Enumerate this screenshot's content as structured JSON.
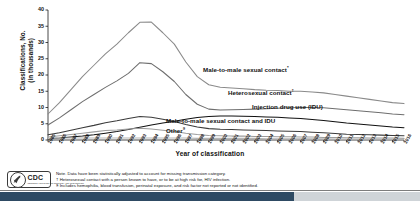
{
  "chart_data": {
    "type": "line",
    "title": "",
    "xlabel": "Year of classification",
    "ylabel_lines": [
      "Classifications, No.",
      "(in thousands)"
    ],
    "ylim": [
      0,
      40
    ],
    "yticks": [
      0,
      5,
      10,
      15,
      20,
      25,
      30,
      35,
      40
    ],
    "grid": false,
    "legend_position": "inline-labels",
    "categories": [
      "1985",
      "1986",
      "1987",
      "1988",
      "1989",
      "1990",
      "1991",
      "1992",
      "1993",
      "1994",
      "1995",
      "1996",
      "1997",
      "1998",
      "1999",
      "2000",
      "2001",
      "2002",
      "2003",
      "2004",
      "2005",
      "2006",
      "2007",
      "2008",
      "2009",
      "2010",
      "2011",
      "2012",
      "2013",
      "2014",
      "2015",
      "2016"
    ],
    "series": [
      {
        "name": "Total",
        "color": "#8a8a8a",
        "values": [
          8.0,
          11.5,
          15.5,
          19.5,
          23.0,
          26.5,
          29.5,
          33.0,
          36.2,
          36.3,
          33.0,
          29.5,
          24.0,
          19.5,
          17.0,
          16.2,
          16.0,
          15.8,
          15.5,
          15.3,
          15.2,
          15.0,
          15.0,
          14.8,
          14.5,
          14.0,
          13.5,
          13.0,
          12.5,
          12.0,
          11.5,
          11.2
        ]
      },
      {
        "name": "Male-to-male sexual contact",
        "color": "#6e6e6e",
        "values": [
          4.6,
          6.8,
          9.3,
          11.8,
          14.0,
          16.2,
          18.2,
          20.5,
          23.8,
          23.5,
          21.0,
          18.0,
          14.0,
          11.0,
          9.5,
          9.2,
          9.3,
          9.4,
          9.5,
          9.6,
          9.8,
          9.9,
          10.0,
          10.0,
          9.9,
          9.6,
          9.3,
          9.0,
          8.7,
          8.4,
          8.0,
          7.8
        ]
      },
      {
        "name": "Heterosexual contact",
        "color": "#111111",
        "values": [
          0.4,
          0.6,
          0.9,
          1.2,
          1.6,
          2.1,
          2.6,
          3.2,
          3.9,
          4.6,
          5.2,
          5.8,
          6.4,
          6.9,
          7.2,
          7.4,
          7.4,
          7.3,
          7.2,
          7.1,
          7.0,
          6.8,
          6.6,
          6.3,
          6.0,
          5.6,
          5.2,
          4.9,
          4.6,
          4.3,
          4.0,
          3.8
        ]
      },
      {
        "name": "Injection drug use (IDU)",
        "color": "#3a3a3a",
        "values": [
          1.6,
          2.2,
          3.0,
          3.8,
          4.5,
          5.3,
          5.9,
          6.6,
          7.2,
          7.0,
          6.4,
          5.7,
          4.8,
          4.0,
          3.5,
          3.3,
          3.2,
          3.1,
          3.0,
          2.9,
          2.8,
          2.7,
          2.6,
          2.4,
          2.2,
          2.0,
          1.8,
          1.7,
          1.6,
          1.5,
          1.4,
          1.3
        ]
      },
      {
        "name": "Male-to-male sexual contact and IDU",
        "color": "#9c9c9c",
        "values": [
          0.9,
          1.3,
          1.7,
          2.1,
          2.5,
          2.9,
          3.1,
          3.4,
          3.6,
          3.4,
          3.0,
          2.6,
          2.1,
          1.7,
          1.4,
          1.3,
          1.2,
          1.2,
          1.1,
          1.1,
          1.0,
          1.0,
          0.9,
          0.9,
          0.8,
          0.8,
          0.7,
          0.7,
          0.6,
          0.6,
          0.6,
          0.5
        ]
      },
      {
        "name": "Other",
        "color": "#b5b5b5",
        "values": [
          0.5,
          0.6,
          0.6,
          0.6,
          0.6,
          0.6,
          0.6,
          0.6,
          0.6,
          0.6,
          0.6,
          0.6,
          0.6,
          0.5,
          0.5,
          0.5,
          0.5,
          0.5,
          0.5,
          0.4,
          0.4,
          0.4,
          0.4,
          0.4,
          0.4,
          0.3,
          0.3,
          0.3,
          0.3,
          0.3,
          0.3,
          0.3
        ]
      }
    ],
    "inline_labels": [
      {
        "text": "Male-to-male sexual contact",
        "marker": "*"
      },
      {
        "text": "Heterosexual contact",
        "marker": "†"
      },
      {
        "text": "Injection drug use (IDU)",
        "marker": ""
      },
      {
        "text": "Male-to-male sexual contact and IDU",
        "marker": ""
      },
      {
        "text": "Other",
        "marker": "§"
      }
    ]
  },
  "footnotes": {
    "note": "Note. Data have been statistically adjusted to account for missing transmission category.",
    "dagger": "Heterosexual contact with a person known to have, or to be at high risk for, HIV infection.",
    "section": "Includes hemophilia, blood transfusion, perinatal exposure, and risk factor not reported or not identified.",
    "dagger_mark": "†",
    "section_mark": "§"
  },
  "logo": {
    "word": "CDC",
    "subtitle": "CENTERS FOR DISEASE CONTROL AND PREVENTION"
  }
}
